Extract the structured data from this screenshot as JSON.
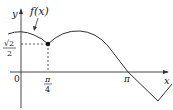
{
  "figure": {
    "function_label": "f(x)",
    "axis_labels": {
      "x": "x",
      "y": "y"
    },
    "origin_label": "0",
    "y_tick": {
      "numerator": "√2",
      "denominator": "2"
    },
    "x_ticks": [
      {
        "numerator": "π",
        "denominator": "4"
      },
      {
        "label": "π"
      }
    ],
    "marked_point": {
      "x": "π/4",
      "y": "√2/2"
    },
    "colors": {
      "curve": "#333333",
      "axes": "#333333",
      "guide": "#333333"
    }
  }
}
